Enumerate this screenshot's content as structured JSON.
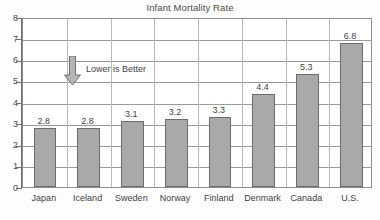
{
  "chart_data": {
    "type": "bar",
    "title": "Infant Mortality Rate",
    "xlabel": "",
    "ylabel": "",
    "ylim": [
      0,
      8
    ],
    "yticks": [
      "0",
      "1",
      "2",
      "3",
      "4",
      "5",
      "6",
      "7",
      "8"
    ],
    "grid": true,
    "legend": "none",
    "categories": [
      "Japan",
      "Iceland",
      "Sweden",
      "Norway",
      "Finland",
      "Denmark",
      "Canada",
      "U.S."
    ],
    "values": [
      2.8,
      2.8,
      3.1,
      3.2,
      3.3,
      4.4,
      5.3,
      6.8
    ],
    "value_labels": [
      "2.8",
      "2.8",
      "3.1",
      "3.2",
      "3.3",
      "4.4",
      "5.3",
      "6.8"
    ],
    "annotations": [
      {
        "text": "Lower is Better",
        "icon": "down-arrow-icon"
      }
    ],
    "colors": {
      "bar_fill": "#a9a9a9",
      "bar_stroke": "#6d6d6d",
      "grid": "#9a9a9a",
      "axis": "#6f6f6f",
      "text": "#3f3f3f",
      "background": "#ffffff"
    }
  }
}
